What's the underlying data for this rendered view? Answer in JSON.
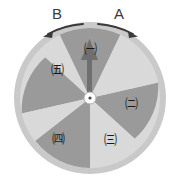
{
  "diagram": {
    "background_color": "#ffffff",
    "direction_arrows": [
      {
        "id": "B",
        "label": "B",
        "sense": "counterclockwise",
        "side": "left"
      },
      {
        "id": "A",
        "label": "A",
        "sense": "clockwise",
        "side": "right"
      }
    ],
    "pointer": {
      "name": "needle",
      "direction": "up",
      "angle_deg": 0,
      "color": "#6b6b6b"
    },
    "hub": {
      "fill": "#ffffff",
      "dot": "#4a4a4a"
    },
    "wheel": {
      "center_x": 90,
      "center_y": 98,
      "radius": 76,
      "rim_color": "#c9c9c9",
      "rim_width": 6,
      "sector_count": 7,
      "sector_angle_deg": 51.4,
      "colors": {
        "light": "#d9d9d9",
        "dark": "#9a9a9a"
      },
      "sectors": [
        {
          "index": 0,
          "shade": "dark",
          "start_deg": -25.7,
          "end_deg": 25.7,
          "label": "㈠",
          "label_x": 90,
          "label_y": 48
        },
        {
          "index": 1,
          "shade": "light",
          "start_deg": 25.7,
          "end_deg": 77.1,
          "label": "",
          "label_x": 0,
          "label_y": 0
        },
        {
          "index": 2,
          "shade": "dark",
          "start_deg": 77.1,
          "end_deg": 128.6,
          "label": "㈡",
          "label_x": 131,
          "label_y": 103
        },
        {
          "index": 3,
          "shade": "light",
          "start_deg": 128.6,
          "end_deg": 180.0,
          "label": "㈢",
          "label_x": 110,
          "label_y": 139
        },
        {
          "index": 4,
          "shade": "dark",
          "start_deg": 180.0,
          "end_deg": 231.4,
          "label": "",
          "label_x": 0,
          "label_y": 0
        },
        {
          "index": 5,
          "shade": "light",
          "start_deg": 231.4,
          "end_deg": 282.9,
          "label": "㈣",
          "label_x": 58,
          "label_y": 138
        },
        {
          "index": 6,
          "shade": "dark",
          "start_deg": 282.9,
          "end_deg": 334.3,
          "label": "",
          "label_x": 0,
          "label_y": 0
        },
        {
          "index": 7,
          "shade": "light",
          "start_deg": 300.0,
          "end_deg": 334.3,
          "label": "㈤",
          "label_x": 57,
          "label_y": 69
        }
      ],
      "labels": [
        {
          "name": "sector-label-giyeok",
          "text": "㈠",
          "x": 90,
          "y": 48
        },
        {
          "name": "sector-label-nieun",
          "text": "㈡",
          "x": 131,
          "y": 103
        },
        {
          "name": "sector-label-digeut",
          "text": "㈢",
          "x": 110,
          "y": 139
        },
        {
          "name": "sector-label-rieul",
          "text": "㈣",
          "x": 58,
          "y": 138
        },
        {
          "name": "sector-label-mieum",
          "text": "㈤",
          "x": 57,
          "y": 69
        }
      ]
    }
  }
}
